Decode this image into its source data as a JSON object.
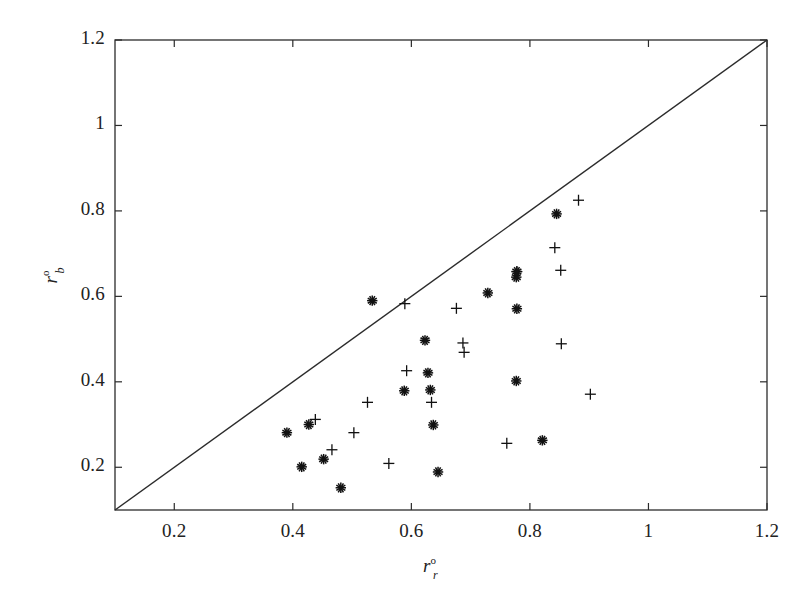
{
  "chart_data": {
    "type": "scatter",
    "title": "",
    "subtitle": "",
    "xlabel": "r_r^o",
    "ylabel": "r_b^o",
    "xlabel_base": "r",
    "xlabel_sup": "o",
    "xlabel_sub": "r",
    "ylabel_base": "r",
    "ylabel_sup": "o",
    "ylabel_sub": "b",
    "xlim": [
      0.1,
      1.2
    ],
    "ylim": [
      0.1,
      1.2
    ],
    "xticks": [
      0.2,
      0.4,
      0.6,
      0.8,
      1.0,
      1.2
    ],
    "yticks": [
      0.2,
      0.4,
      0.6,
      0.8,
      1.0,
      1.2
    ],
    "xtick_labels": [
      "0.2",
      "0.4",
      "0.6",
      "0.8",
      "1",
      "1.2"
    ],
    "ytick_labels": [
      "0.2",
      "0.4",
      "0.6",
      "0.8",
      "1",
      "1.2"
    ],
    "grid": false,
    "legend": null,
    "frame": true,
    "tick_direction": "in",
    "colors": {
      "axis": "#2b2b2b",
      "marker": "#111111",
      "reference_line": "#2b2b2b",
      "background": "#ffffff"
    },
    "annotations": [
      {
        "kind": "reference-line",
        "label": "y = x identity line",
        "from": [
          0.1,
          0.1
        ],
        "to": [
          1.2,
          1.2
        ]
      }
    ],
    "series": [
      {
        "name": "asterisk-series",
        "marker": "asterisk",
        "points": [
          [
            0.39,
            0.281
          ],
          [
            0.415,
            0.201
          ],
          [
            0.427,
            0.3
          ],
          [
            0.452,
            0.219
          ],
          [
            0.481,
            0.152
          ],
          [
            0.534,
            0.59
          ],
          [
            0.588,
            0.379
          ],
          [
            0.623,
            0.497
          ],
          [
            0.628,
            0.421
          ],
          [
            0.632,
            0.381
          ],
          [
            0.637,
            0.299
          ],
          [
            0.645,
            0.189
          ],
          [
            0.729,
            0.608
          ],
          [
            0.777,
            0.645
          ],
          [
            0.778,
            0.658
          ],
          [
            0.777,
            0.402
          ],
          [
            0.778,
            0.571
          ],
          [
            0.821,
            0.263
          ],
          [
            0.845,
            0.793
          ]
        ]
      },
      {
        "name": "plus-series",
        "marker": "plus",
        "points": [
          [
            0.438,
            0.312
          ],
          [
            0.466,
            0.241
          ],
          [
            0.503,
            0.281
          ],
          [
            0.526,
            0.352
          ],
          [
            0.562,
            0.209
          ],
          [
            0.589,
            0.583
          ],
          [
            0.592,
            0.426
          ],
          [
            0.634,
            0.352
          ],
          [
            0.676,
            0.572
          ],
          [
            0.687,
            0.491
          ],
          [
            0.689,
            0.469
          ],
          [
            0.761,
            0.256
          ],
          [
            0.778,
            0.658
          ],
          [
            0.842,
            0.714
          ],
          [
            0.852,
            0.661
          ],
          [
            0.853,
            0.489
          ],
          [
            0.882,
            0.825
          ],
          [
            0.902,
            0.371
          ]
        ]
      }
    ]
  },
  "plot_geometry": {
    "left_px": 115,
    "right_px": 767,
    "top_px": 40,
    "bottom_px": 510
  }
}
